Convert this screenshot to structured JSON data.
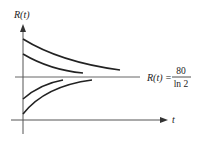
{
  "diagram": {
    "type": "solution-curves",
    "y_axis_label": "R(t)",
    "x_axis_label": "t",
    "equilibrium": {
      "lhs": "R(t) =",
      "numerator": "80",
      "denominator": "ln 2"
    },
    "curves": [
      {
        "name": "curve-above-1",
        "direction": "decreasing toward equilibrium"
      },
      {
        "name": "curve-above-2",
        "direction": "decreasing toward equilibrium"
      },
      {
        "name": "curve-below-1",
        "direction": "increasing toward equilibrium"
      },
      {
        "name": "curve-below-2",
        "direction": "increasing toward equilibrium"
      }
    ],
    "colors": {
      "ink": "#222222",
      "axis": "#444444",
      "background": "#ffffff"
    }
  }
}
